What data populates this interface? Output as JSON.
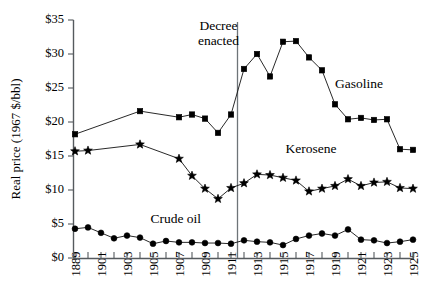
{
  "chart_data": {
    "type": "line",
    "title": "",
    "xlabel": "",
    "ylabel": "Real price (1967 $/bbl)",
    "ylim": [
      0,
      35
    ],
    "ytick_labels": [
      "$0",
      "$5",
      "$10",
      "$15",
      "$20",
      "$25",
      "$30",
      "$35"
    ],
    "ytick_values": [
      0,
      5,
      10,
      15,
      20,
      25,
      30,
      35
    ],
    "grid": false,
    "legend_position": "inline-labels",
    "x": [
      1889,
      1900,
      1901,
      1902,
      1903,
      1904,
      1905,
      1906,
      1907,
      1908,
      1909,
      1910,
      1911,
      1912,
      1913,
      1914,
      1915,
      1916,
      1917,
      1918,
      1919,
      1920,
      1921,
      1922,
      1923,
      1924,
      1925
    ],
    "xtick_labels": [
      "1889",
      "1901",
      "1903",
      "1905",
      "1907",
      "1909",
      "1911",
      "1913",
      "1915",
      "1917",
      "1919",
      "1921",
      "1923",
      "1925"
    ],
    "xtick_label_years": [
      1889,
      1901,
      1903,
      1905,
      1907,
      1909,
      1911,
      1913,
      1915,
      1917,
      1919,
      1921,
      1923,
      1925
    ],
    "series": [
      {
        "name": "Gasoline",
        "marker": "square",
        "label_x": 1919.0,
        "label_y": 25.0,
        "values": [
          18.2,
          null,
          null,
          null,
          null,
          21.6,
          null,
          null,
          20.7,
          21.1,
          20.5,
          18.4,
          21.1,
          27.8,
          30.0,
          26.7,
          31.8,
          31.9,
          29.5,
          27.6,
          22.6,
          20.4,
          20.6,
          20.3,
          20.4,
          16.0,
          15.9
        ]
      },
      {
        "name": "Kerosene",
        "marker": "star",
        "label_x": 1915.2,
        "label_y": 15.4,
        "values": [
          15.7,
          15.8,
          null,
          null,
          null,
          16.7,
          null,
          null,
          14.6,
          12.1,
          10.2,
          8.7,
          10.3,
          11.0,
          12.3,
          12.2,
          11.8,
          11.4,
          9.8,
          10.2,
          10.6,
          11.6,
          10.6,
          11.1,
          11.2,
          10.3,
          10.2
        ]
      },
      {
        "name": "Crude oil",
        "marker": "circle",
        "label_x": 1904.8,
        "label_y": 5.2,
        "values": [
          4.3,
          4.5,
          3.7,
          2.9,
          3.3,
          3.0,
          2.1,
          2.5,
          2.3,
          2.3,
          2.2,
          2.2,
          2.1,
          2.6,
          2.4,
          2.3,
          1.9,
          2.8,
          3.3,
          3.6,
          3.3,
          4.2,
          2.7,
          2.6,
          2.2,
          2.4,
          2.7
        ]
      }
    ],
    "annotations": [
      {
        "name": "decree-enacted",
        "line1": "Decree",
        "line2": "enacted",
        "at_x": 1911.5
      }
    ]
  }
}
